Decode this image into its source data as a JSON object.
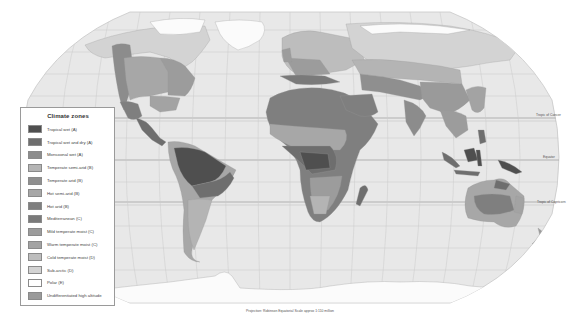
{
  "map": {
    "type": "world-climate-zones",
    "projection_note": "Projection: Robinson   Equatorial Scale approx 1:110 million",
    "reference_lines": [
      {
        "name": "Tropic of Cancer",
        "label": "Tropic of Cancer"
      },
      {
        "name": "Equator",
        "label": "Equator"
      },
      {
        "name": "Tropic of Capricorn",
        "label": "Tropic of Capricorn"
      }
    ],
    "ocean_color": "#e8e8e8",
    "graticule_color": "#c4c4c4"
  },
  "legend": {
    "title": "Climate zones",
    "items": [
      {
        "label": "Tropical wet (A)",
        "color": "#4f4f4f"
      },
      {
        "label": "Tropical wet and dry (A)",
        "color": "#6e6e6e"
      },
      {
        "label": "Monsoonal wet (A)",
        "color": "#8c8c8c"
      },
      {
        "label": "Temperate semi-arid (B)",
        "color": "#b4b4b4"
      },
      {
        "label": "Temperate arid (B)",
        "color": "#8f8f8f"
      },
      {
        "label": "Hot semi-arid (B)",
        "color": "#a7a7a7"
      },
      {
        "label": "Hot arid (B)",
        "color": "#7f7f7f"
      },
      {
        "label": "Mediterranean (C)",
        "color": "#7a7a7a"
      },
      {
        "label": "Mild temperate moist (C)",
        "color": "#9c9c9c"
      },
      {
        "label": "Warm temperate moist (C)",
        "color": "#a3a3a3"
      },
      {
        "label": "Cold temperate moist (D)",
        "color": "#bdbdbd"
      },
      {
        "label": "Sub-arctic (D)",
        "color": "#d3d3d3"
      },
      {
        "label": "Polar (E)",
        "color": "#ffffff"
      },
      {
        "label": "Undifferentiated high altitude",
        "color": "#9a9a9a"
      }
    ]
  }
}
